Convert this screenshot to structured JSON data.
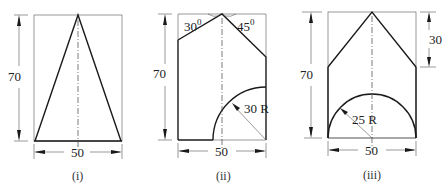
{
  "figures": [
    {
      "id": "i",
      "caption": "(i)",
      "height_label": "70",
      "width_label": "50",
      "description": "Isosceles triangle inscribed in 50 x 70 rectangle, apex at top center"
    },
    {
      "id": "ii",
      "caption": "(ii)",
      "height_label": "70",
      "width_label": "50",
      "angle_left_label": "30",
      "angle_right_label": "45",
      "angle_unit": "0",
      "radius_label": "30 R",
      "description": "Rectangle with top cut at 30 and 45 degrees from apex, quarter-arc of radius 30 at bottom right"
    },
    {
      "id": "iii",
      "caption": "(iii)",
      "height_label": "70",
      "width_label": "50",
      "top_height_label": "30",
      "radius_label": "25 R",
      "description": "Pentagon-shaped profile with semicircle of radius 25 at base"
    }
  ]
}
